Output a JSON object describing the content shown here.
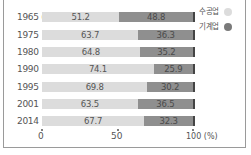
{
  "chart_data": {
    "type": "bar",
    "orientation": "horizontal",
    "stacked": true,
    "normalized_percent": true,
    "title": "",
    "xlabel": "(%)",
    "ylabel": "(년)",
    "categories": [
      "1965",
      "1975",
      "1980",
      "1990",
      "1995",
      "2001",
      "2014"
    ],
    "category_labels": [
      "1965 (년)",
      "1975",
      "1980",
      "1990",
      "1995",
      "2001",
      "2014"
    ],
    "series": [
      {
        "name": "수공업",
        "color": "#dcdcdc",
        "values": [
          51.2,
          63.7,
          64.8,
          74.1,
          69.8,
          63.5,
          67.7
        ]
      },
      {
        "name": "기계업",
        "color": "#8f8f8f",
        "values": [
          48.8,
          36.3,
          35.2,
          25.9,
          30.2,
          36.5,
          32.3
        ]
      }
    ],
    "value_labels": [
      [
        "51.2",
        "48.8"
      ],
      [
        "63.7",
        "36.3"
      ],
      [
        "64.8",
        "35.2"
      ],
      [
        "74.1",
        "25.9"
      ],
      [
        "69.8",
        "30.2"
      ],
      [
        "63.5",
        "36.5"
      ],
      [
        "67.7",
        "32.3"
      ]
    ],
    "xticks": [
      "0",
      "50",
      "100 (%)"
    ],
    "xlim": [
      0,
      100
    ],
    "grid": false,
    "legend_position": "top-right"
  },
  "axis": {
    "tick_0": "0",
    "tick_50": "50",
    "tick_100": "100 (%)"
  },
  "legend": {
    "item_a": "수공업",
    "item_b": "기계업"
  },
  "rows": [
    {
      "year": "1965 (년)",
      "a": "51.2",
      "b": "48.8"
    },
    {
      "year": "1975",
      "a": "63.7",
      "b": "36.3"
    },
    {
      "year": "1980",
      "a": "64.8",
      "b": "35.2"
    },
    {
      "year": "1990",
      "a": "74.1",
      "b": "25.9"
    },
    {
      "year": "1995",
      "a": "69.8",
      "b": "30.2"
    },
    {
      "year": "2001",
      "a": "63.5",
      "b": "36.5"
    },
    {
      "year": "2014",
      "a": "67.7",
      "b": "32.3"
    }
  ]
}
